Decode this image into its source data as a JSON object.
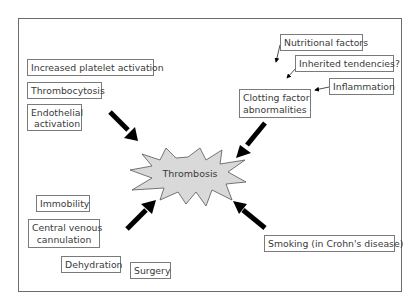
{
  "diagram": {
    "center": {
      "label": "Thrombosis",
      "fill": "#d9d9d9",
      "stroke": "#555555"
    },
    "factors": [
      {
        "id": "platelet",
        "label": "Increased platelet activation",
        "group": "top-left"
      },
      {
        "id": "thrombocytosis",
        "label": "Thrombocytosis",
        "group": "top-left"
      },
      {
        "id": "endothelial",
        "label_line1": "Endothelial",
        "label_line2": "activation",
        "group": "top-left"
      },
      {
        "id": "nutritional",
        "label": "Nutritional factors",
        "group": "top-right"
      },
      {
        "id": "inherited",
        "label": "Inherited tendencies?",
        "group": "top-right"
      },
      {
        "id": "inflammation",
        "label": "Inflammation",
        "group": "top-right"
      },
      {
        "id": "clotting",
        "label_line1": "Clotting factor",
        "label_line2": "abnormalities",
        "group": "top-right"
      },
      {
        "id": "immobility",
        "label": "Immobility",
        "group": "bottom-left"
      },
      {
        "id": "cvc",
        "label_line1": "Central venous",
        "label_line2": "cannulation",
        "group": "bottom-left"
      },
      {
        "id": "dehydration",
        "label": "Dehydration",
        "group": "bottom-left"
      },
      {
        "id": "surgery",
        "label": "Surgery",
        "group": "bottom-left"
      },
      {
        "id": "smoking",
        "label": "Smoking (in Crohn's disease)",
        "group": "bottom-right"
      }
    ],
    "arrows": [
      {
        "from": "top-left",
        "to": "center",
        "style": "thick"
      },
      {
        "from": "top-right",
        "to": "center",
        "style": "thick"
      },
      {
        "from": "bottom-left",
        "to": "center",
        "style": "thick"
      },
      {
        "from": "bottom-right",
        "to": "center",
        "style": "thick"
      },
      {
        "from": "nutritional",
        "to": "clotting",
        "style": "thin"
      },
      {
        "from": "inherited",
        "to": "clotting",
        "style": "thin"
      },
      {
        "from": "inflammation",
        "to": "clotting",
        "style": "thin"
      }
    ],
    "colors": {
      "border": "#7a7a7a",
      "arrow": "#000000",
      "text": "#3a3a3a"
    }
  }
}
